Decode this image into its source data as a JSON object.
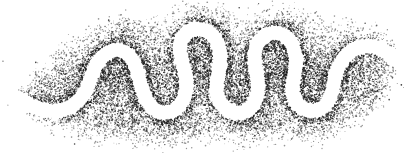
{
  "figure": {
    "title": "Meandering river channel in stipple",
    "caption": "",
    "width": 405,
    "height": 159,
    "background_color": "#ffffff",
    "stipple_color": "#1a1a1a",
    "channel_color": "#ffffff",
    "medium": "pen-and-ink stipple drawing"
  },
  "chart_data": {
    "type": "scatter",
    "title": "Meandering river channel in stipple",
    "subtitle": "",
    "xlabel": "",
    "ylabel": "",
    "xlim": [
      0,
      405
    ],
    "ylim": [
      0,
      159
    ],
    "grid": false,
    "legend": "none",
    "annotations": [],
    "render": {
      "dot_count": 15000,
      "dot_radius_min": 0.35,
      "dot_radius_max": 0.85,
      "dot_color": "#1a1a1a",
      "dot_opacity_min": 0.45,
      "dot_opacity_max": 1.0,
      "random_seed": 20240517,
      "edge_fade_px": 16,
      "bank_darkening_px": 9,
      "bank_darkening_strength": 2.6
    },
    "channel_path": {
      "description": "White sinuous river channel band; centerline sampled left to right",
      "half_width": 7.0,
      "centerline": [
        [
          4,
          92
        ],
        [
          14,
          97
        ],
        [
          26,
          103
        ],
        [
          38,
          108
        ],
        [
          50,
          111
        ],
        [
          62,
          110
        ],
        [
          72,
          106
        ],
        [
          80,
          99
        ],
        [
          86,
          90
        ],
        [
          90,
          80
        ],
        [
          94,
          70
        ],
        [
          99,
          61
        ],
        [
          106,
          54
        ],
        [
          115,
          50
        ],
        [
          124,
          52
        ],
        [
          131,
          58
        ],
        [
          136,
          67
        ],
        [
          139,
          78
        ],
        [
          142,
          89
        ],
        [
          146,
          99
        ],
        [
          152,
          107
        ],
        [
          160,
          112
        ],
        [
          169,
          112
        ],
        [
          177,
          108
        ],
        [
          183,
          100
        ],
        [
          186,
          90
        ],
        [
          186,
          79
        ],
        [
          184,
          68
        ],
        [
          181,
          57
        ],
        [
          180,
          46
        ],
        [
          183,
          37
        ],
        [
          190,
          31
        ],
        [
          199,
          29
        ],
        [
          208,
          32
        ],
        [
          215,
          39
        ],
        [
          219,
          49
        ],
        [
          220,
          60
        ],
        [
          219,
          71
        ],
        [
          217,
          82
        ],
        [
          217,
          93
        ],
        [
          221,
          103
        ],
        [
          228,
          110
        ],
        [
          237,
          113
        ],
        [
          246,
          111
        ],
        [
          253,
          105
        ],
        [
          257,
          96
        ],
        [
          258,
          86
        ],
        [
          257,
          75
        ],
        [
          255,
          64
        ],
        [
          255,
          53
        ],
        [
          258,
          43
        ],
        [
          265,
          36
        ],
        [
          274,
          33
        ],
        [
          283,
          35
        ],
        [
          290,
          41
        ],
        [
          294,
          50
        ],
        [
          296,
          61
        ],
        [
          295,
          72
        ],
        [
          293,
          83
        ],
        [
          293,
          94
        ],
        [
          297,
          103
        ],
        [
          304,
          109
        ],
        [
          313,
          111
        ],
        [
          322,
          108
        ],
        [
          328,
          101
        ],
        [
          332,
          92
        ],
        [
          334,
          82
        ],
        [
          337,
          71
        ],
        [
          342,
          61
        ],
        [
          349,
          53
        ],
        [
          358,
          48
        ],
        [
          368,
          46
        ],
        [
          378,
          48
        ],
        [
          387,
          53
        ],
        [
          395,
          59
        ],
        [
          402,
          66
        ]
      ]
    },
    "floodplain_outline": {
      "description": "Outer boundary of the stippled floodplain deposit; dot density fades to zero outside",
      "top": [
        [
          20,
          92
        ],
        [
          40,
          72
        ],
        [
          60,
          52
        ],
        [
          80,
          38
        ],
        [
          100,
          28
        ],
        [
          120,
          22
        ],
        [
          140,
          26
        ],
        [
          160,
          20
        ],
        [
          180,
          12
        ],
        [
          200,
          8
        ],
        [
          220,
          12
        ],
        [
          240,
          20
        ],
        [
          258,
          16
        ],
        [
          276,
          10
        ],
        [
          296,
          14
        ],
        [
          316,
          22
        ],
        [
          334,
          28
        ],
        [
          352,
          24
        ],
        [
          372,
          28
        ],
        [
          390,
          40
        ],
        [
          402,
          54
        ]
      ],
      "bottom": [
        [
          18,
          100
        ],
        [
          36,
          114
        ],
        [
          56,
          126
        ],
        [
          76,
          132
        ],
        [
          96,
          136
        ],
        [
          116,
          134
        ],
        [
          136,
          138
        ],
        [
          156,
          142
        ],
        [
          176,
          140
        ],
        [
          196,
          134
        ],
        [
          216,
          138
        ],
        [
          236,
          142
        ],
        [
          256,
          138
        ],
        [
          276,
          132
        ],
        [
          296,
          136
        ],
        [
          316,
          140
        ],
        [
          334,
          134
        ],
        [
          352,
          124
        ],
        [
          368,
          112
        ],
        [
          382,
          98
        ],
        [
          392,
          84
        ]
      ]
    },
    "density_field": {
      "description": "Relative stipple density blobs (x, y, radius, weight)",
      "blobs": [
        [
          110,
          70,
          34,
          0.9
        ],
        [
          150,
          80,
          30,
          0.95
        ],
        [
          196,
          60,
          30,
          1.0
        ],
        [
          238,
          78,
          32,
          0.95
        ],
        [
          276,
          62,
          30,
          1.0
        ],
        [
          314,
          80,
          30,
          0.9
        ],
        [
          352,
          66,
          30,
          0.75
        ],
        [
          70,
          90,
          30,
          0.7
        ],
        [
          40,
          100,
          24,
          0.45
        ],
        [
          180,
          120,
          34,
          0.8
        ],
        [
          260,
          120,
          34,
          0.75
        ],
        [
          120,
          120,
          30,
          0.7
        ],
        [
          320,
          112,
          28,
          0.7
        ],
        [
          210,
          28,
          26,
          0.6
        ],
        [
          290,
          30,
          24,
          0.6
        ],
        [
          130,
          36,
          26,
          0.55
        ],
        [
          372,
          92,
          24,
          0.55
        ]
      ]
    }
  }
}
